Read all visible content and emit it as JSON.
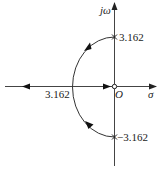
{
  "diagram": {
    "type": "root-locus",
    "axes": {
      "x_label": "σ",
      "y_label": "jω",
      "origin_label": "O"
    },
    "poles": [
      {
        "label": "3.162",
        "re": 0,
        "im": 3.162
      },
      {
        "label": "−3.162",
        "re": 0,
        "im": -3.162
      }
    ],
    "zeros": [
      {
        "label": "O",
        "re": 0,
        "im": 0
      }
    ],
    "breakaway_point": {
      "label": "3.162",
      "re": -3.162,
      "im": 0
    },
    "colors": {
      "stroke": "#333333",
      "text": "#222222"
    }
  }
}
